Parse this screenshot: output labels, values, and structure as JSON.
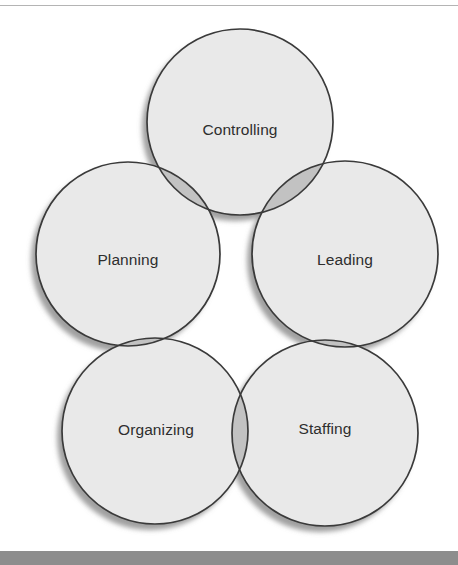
{
  "figure": {
    "type": "venn-circles"
  },
  "chart_data": {
    "type": "pie",
    "xlabel": "",
    "ylabel": "",
    "categories": [
      "Controlling",
      "Planning",
      "Leading",
      "Organizing",
      "Staffing"
    ],
    "values": [
      1,
      1,
      1,
      1,
      1
    ],
    "legend_position": "none",
    "grid": false,
    "annotations": []
  },
  "colors": {
    "circle_fill": "#e9e9e9",
    "overlap_fill": "#c2c2c2",
    "stroke": "#3a3a3a",
    "shadow": "#9a9a9a",
    "label_text": "#2e2e2e",
    "top_rule": "#b4b4b4",
    "bottom_bar": "#8d8d8d",
    "page_background": "#ffffff"
  },
  "circles": [
    {
      "id": "controlling",
      "label": "Controlling",
      "cx": 240,
      "cy": 122,
      "r": 93,
      "label_x": 240,
      "label_y": 131
    },
    {
      "id": "planning",
      "label": "Planning",
      "cx": 128,
      "cy": 254,
      "r": 92,
      "label_x": 128,
      "label_y": 261
    },
    {
      "id": "leading",
      "label": "Leading",
      "cx": 345,
      "cy": 254,
      "r": 93,
      "label_x": 345,
      "label_y": 261
    },
    {
      "id": "organizing",
      "label": "Organizing",
      "cx": 155,
      "cy": 431,
      "r": 93,
      "label_x": 156,
      "label_y": 431
    },
    {
      "id": "staffing",
      "label": "Staffing",
      "cx": 325,
      "cy": 433,
      "r": 93,
      "label_x": 325,
      "label_y": 430
    }
  ],
  "overlaps": [
    {
      "id": "controlling-planning",
      "a": "controlling",
      "b": "planning"
    },
    {
      "id": "controlling-leading",
      "a": "controlling",
      "b": "leading"
    },
    {
      "id": "planning-organizing",
      "a": "planning",
      "b": "organizing"
    },
    {
      "id": "leading-staffing",
      "a": "leading",
      "b": "staffing"
    },
    {
      "id": "organizing-staffing",
      "a": "organizing",
      "b": "staffing"
    }
  ]
}
